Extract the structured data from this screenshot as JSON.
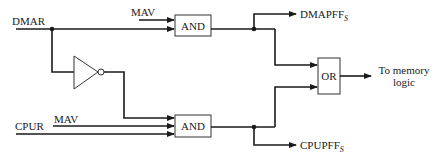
{
  "diagram": {
    "type": "logic-circuit",
    "inputs": {
      "dmar": "DMAR",
      "mav_top": "MAV",
      "cpur": "CPUR",
      "mav_bottom": "MAV"
    },
    "gates": {
      "and_top": "AND",
      "and_bottom": "AND",
      "or": "OR",
      "inverter": "NOT"
    },
    "outputs": {
      "dmapff": {
        "base": "DMAPFF",
        "subscript": "S"
      },
      "cpupff": {
        "base": "CPUPFF",
        "subscript": "S"
      },
      "memory_line1": "To memory",
      "memory_line2": "logic"
    },
    "colors": {
      "line": "#1a1a1a",
      "background": "#ffffff"
    }
  }
}
